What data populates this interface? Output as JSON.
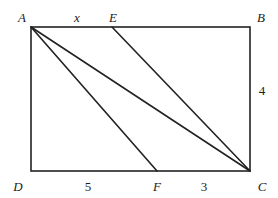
{
  "diagram": {
    "type": "geometry",
    "points": {
      "A": {
        "label": "A",
        "x": 31,
        "y": 27
      },
      "B": {
        "label": "B",
        "x": 250,
        "y": 27
      },
      "C": {
        "label": "C",
        "x": 250,
        "y": 171
      },
      "D": {
        "label": "D",
        "x": 31,
        "y": 171
      },
      "E": {
        "label": "E",
        "x": 112,
        "y": 27
      },
      "F": {
        "label": "F",
        "x": 157,
        "y": 171
      }
    },
    "segments": [
      [
        "A",
        "B"
      ],
      [
        "B",
        "C"
      ],
      [
        "C",
        "D"
      ],
      [
        "D",
        "A"
      ],
      [
        "A",
        "F"
      ],
      [
        "A",
        "C"
      ],
      [
        "E",
        "C"
      ]
    ],
    "measures": {
      "AE": "x",
      "BC": "4",
      "DF": "5",
      "FC": "3"
    },
    "stroke_color": "#222222"
  }
}
